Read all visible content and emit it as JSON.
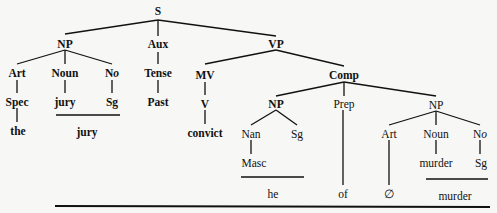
{
  "diagram": {
    "type": "syntax-tree",
    "nodes": {
      "S": "S",
      "NP1": "NP",
      "Aux": "Aux",
      "VP": "VP",
      "Art1": "Art",
      "Noun1": "Noun",
      "No1": "No",
      "Tense": "Tense",
      "MV": "MV",
      "Comp": "Comp",
      "Spec": "Spec",
      "jury_t": "jury",
      "Sg1": "Sg",
      "Past": "Past",
      "V": "V",
      "NP2": "NP",
      "Prep": "Prep",
      "NP3": "NP",
      "Nan": "Nan",
      "Sg2": "Sg",
      "Masc": "Masc",
      "Art2": "Art",
      "Noun2": "Noun",
      "No2": "No",
      "murder_t": "murder",
      "Sg3": "Sg"
    },
    "surface": {
      "the": "the",
      "jury": "jury",
      "convict": "convict",
      "he": "he",
      "of": "of",
      "null": "∅",
      "murder": "murder"
    },
    "edges": [
      [
        "S",
        "NP1"
      ],
      [
        "S",
        "Aux"
      ],
      [
        "S",
        "VP"
      ],
      [
        "NP1",
        "Art1"
      ],
      [
        "NP1",
        "Noun1"
      ],
      [
        "NP1",
        "No1"
      ],
      [
        "Aux",
        "Tense"
      ],
      [
        "VP",
        "MV"
      ],
      [
        "VP",
        "Comp"
      ],
      [
        "Art1",
        "Spec"
      ],
      [
        "Noun1",
        "jury_t"
      ],
      [
        "No1",
        "Sg1"
      ],
      [
        "Tense",
        "Past"
      ],
      [
        "MV",
        "V"
      ],
      [
        "Comp",
        "NP2"
      ],
      [
        "Comp",
        "Prep"
      ],
      [
        "Comp",
        "NP3"
      ],
      [
        "NP2",
        "Nan"
      ],
      [
        "NP2",
        "Sg2"
      ],
      [
        "Nan",
        "Masc"
      ],
      [
        "NP3",
        "Art2"
      ],
      [
        "NP3",
        "Noun2"
      ],
      [
        "NP3",
        "No2"
      ],
      [
        "Noun2",
        "murder_t"
      ],
      [
        "No2",
        "Sg3"
      ],
      [
        "Spec",
        "the"
      ],
      [
        "V",
        "convict"
      ],
      [
        "Prep",
        "of"
      ],
      [
        "Art2",
        "null"
      ]
    ]
  }
}
